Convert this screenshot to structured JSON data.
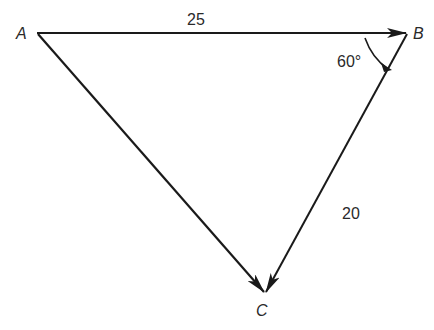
{
  "diagram": {
    "type": "vector-triangle",
    "points": {
      "A": {
        "label": "A",
        "x": 37,
        "y": 33
      },
      "B": {
        "label": "B",
        "x": 407,
        "y": 33
      },
      "C": {
        "label": "C",
        "x": 265,
        "y": 293
      }
    },
    "vectors": [
      {
        "from": "A",
        "to": "B",
        "magnitude_label": "25"
      },
      {
        "from": "B",
        "to": "C",
        "magnitude_label": "20"
      },
      {
        "from": "A",
        "to": "C",
        "magnitude_label": ""
      }
    ],
    "angle": {
      "vertex": "B",
      "label": "60°"
    },
    "labels": {
      "a": "A",
      "b": "B",
      "c": "C",
      "ab": "25",
      "bc": "20",
      "angle_b": "60°"
    },
    "colors": {
      "line": "#1a1a1a",
      "text": "#2a2a2a",
      "background": "#ffffff"
    }
  }
}
